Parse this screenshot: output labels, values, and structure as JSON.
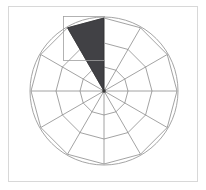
{
  "figure": {
    "title": "",
    "width": 206,
    "height": 190,
    "background_color": "#ffffff",
    "frame_color": "#d8d8d8",
    "frame": {
      "x": 8,
      "y": 6,
      "width": 190,
      "height": 176
    }
  },
  "chart_data": {
    "type": "pie",
    "subtype": "polar-sector-grid",
    "title": "",
    "xlabel": "",
    "ylabel": "",
    "grid": true,
    "legend_position": "none",
    "center": {
      "x": 104,
      "y": 91
    },
    "outer_radius": 73,
    "sector_count": 12,
    "sector_angle_degrees": 30,
    "start_angle_degrees": -90,
    "ring_radii": [
      24,
      48,
      73
    ],
    "ring_count": 3,
    "categories": [
      "1",
      "2",
      "3",
      "4",
      "5",
      "6",
      "7",
      "8",
      "9",
      "10",
      "11",
      "12"
    ],
    "values": [
      1,
      1,
      1,
      1,
      1,
      1,
      1,
      1,
      1,
      1,
      1,
      1
    ],
    "highlighted_sector_index": 11,
    "highlighted_sector_start_degrees": -120,
    "highlighted_sector_end_degrees": -90,
    "highlighted_sector_radius": 73,
    "annotations": [
      {
        "name": "selection-bounding-box",
        "x": 63,
        "y": 16,
        "width": 41,
        "height": 44
      }
    ]
  },
  "colors": {
    "grid_line": "#8c8c8c",
    "outer_circle": "#9a9a9a",
    "spoke_line": "#8c8c8c",
    "highlight_fill": "#414145",
    "highlight_stroke": "#2e2e31",
    "bbox_stroke": "#a0a0a0",
    "center_dot": "#3a3a3a"
  },
  "axes": {
    "radial_ticks": [
      "inner",
      "middle",
      "outer"
    ],
    "angular_ticks": [
      0,
      30,
      60,
      90,
      120,
      150,
      180,
      210,
      240,
      270,
      300,
      330
    ]
  }
}
